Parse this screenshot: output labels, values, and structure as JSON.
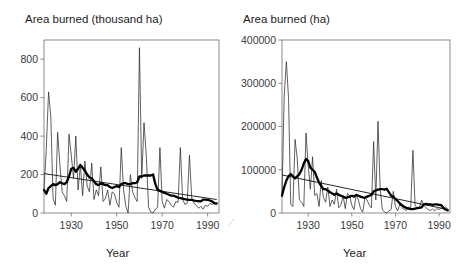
{
  "figure": {
    "panels": [
      {
        "id": "left",
        "title": "Area burned (thousand ha)",
        "xlabel": "Year",
        "ylabel": ""
      },
      {
        "id": "right",
        "title": "Area burned (ha)",
        "xlabel": "Year",
        "ylabel": ""
      }
    ]
  },
  "chart_data": [
    {
      "type": "line",
      "title": "Area burned (thousand ha)",
      "xlabel": "Year",
      "ylabel": "Area burned (thousand ha)",
      "xlim": [
        1918,
        1995
      ],
      "ylim": [
        0,
        900
      ],
      "xticks": [
        1930,
        1950,
        1970,
        1990
      ],
      "yticks": [
        0,
        200,
        400,
        600,
        800
      ],
      "ytick_labels": [
        "0",
        "200",
        "400",
        "600",
        "800"
      ],
      "xtick_labels": [
        "1930",
        "1950",
        "1970",
        "1990"
      ],
      "grid": false,
      "legend": "none",
      "series": [
        {
          "name": "Annual area burned",
          "style": "thin-line",
          "x": [
            1918,
            1919,
            1920,
            1921,
            1922,
            1923,
            1924,
            1925,
            1926,
            1927,
            1928,
            1929,
            1930,
            1931,
            1932,
            1933,
            1934,
            1935,
            1936,
            1937,
            1938,
            1939,
            1940,
            1941,
            1942,
            1943,
            1944,
            1945,
            1946,
            1947,
            1948,
            1949,
            1950,
            1951,
            1952,
            1953,
            1954,
            1955,
            1956,
            1957,
            1958,
            1959,
            1960,
            1961,
            1962,
            1963,
            1964,
            1965,
            1966,
            1967,
            1968,
            1969,
            1970,
            1971,
            1972,
            1973,
            1974,
            1975,
            1976,
            1977,
            1978,
            1979,
            1980,
            1981,
            1982,
            1983,
            1984,
            1985,
            1986,
            1987,
            1988,
            1989,
            1990,
            1991,
            1992,
            1993,
            1994
          ],
          "values": [
            120,
            330,
            630,
            500,
            75,
            40,
            420,
            250,
            110,
            90,
            60,
            410,
            300,
            180,
            400,
            120,
            250,
            90,
            270,
            140,
            110,
            260,
            70,
            120,
            90,
            240,
            60,
            75,
            120,
            40,
            110,
            100,
            55,
            30,
            340,
            120,
            35,
            0,
            200,
            110,
            80,
            60,
            860,
            180,
            470,
            300,
            30,
            5,
            0,
            20,
            30,
            340,
            60,
            25,
            70,
            60,
            40,
            30,
            60,
            55,
            340,
            70,
            45,
            50,
            300,
            80,
            50,
            40,
            25,
            35,
            20,
            40,
            35,
            50,
            45,
            55,
            40
          ]
        },
        {
          "name": "Smoothed (running mean)",
          "style": "thick-line",
          "x": [
            1918,
            1919,
            1920,
            1921,
            1922,
            1923,
            1924,
            1925,
            1926,
            1927,
            1928,
            1929,
            1930,
            1931,
            1932,
            1933,
            1934,
            1935,
            1936,
            1937,
            1938,
            1939,
            1940,
            1941,
            1942,
            1943,
            1944,
            1945,
            1946,
            1947,
            1948,
            1949,
            1950,
            1951,
            1952,
            1953,
            1954,
            1955,
            1956,
            1957,
            1958,
            1959,
            1960,
            1961,
            1962,
            1963,
            1964,
            1965,
            1966,
            1967,
            1968,
            1969,
            1970,
            1971,
            1972,
            1973,
            1974,
            1975,
            1976,
            1977,
            1978,
            1979,
            1980,
            1981,
            1982,
            1983,
            1984,
            1985,
            1986,
            1987,
            1988,
            1989,
            1990,
            1991,
            1992,
            1993,
            1994
          ],
          "values": [
            120,
            100,
            130,
            140,
            150,
            145,
            150,
            160,
            155,
            150,
            160,
            190,
            230,
            235,
            215,
            230,
            250,
            235,
            220,
            200,
            185,
            180,
            165,
            150,
            145,
            155,
            150,
            145,
            145,
            135,
            130,
            135,
            140,
            135,
            150,
            155,
            155,
            150,
            150,
            155,
            155,
            160,
            190,
            190,
            195,
            195,
            195,
            195,
            200,
            150,
            120,
            115,
            110,
            105,
            100,
            95,
            90,
            90,
            85,
            80,
            78,
            75,
            72,
            70,
            68,
            68,
            65,
            62,
            62,
            60,
            70,
            70,
            68,
            65,
            60,
            50,
            50
          ]
        },
        {
          "name": "Linear trend",
          "style": "thin-straight",
          "x": [
            1918,
            1994
          ],
          "values": [
            205,
            70
          ]
        }
      ]
    },
    {
      "type": "line",
      "title": "Area burned (ha)",
      "xlabel": "Year",
      "ylabel": "Area burned (ha)",
      "xlim": [
        1918,
        1995
      ],
      "ylim": [
        0,
        400000
      ],
      "xticks": [
        1930,
        1950,
        1970,
        1990
      ],
      "yticks": [
        0,
        100000,
        200000,
        300000,
        400000
      ],
      "ytick_labels": [
        "0",
        "100000",
        "200000",
        "300000",
        "400000"
      ],
      "xtick_labels": [
        "1930",
        "1950",
        "1970",
        "1990"
      ],
      "grid": false,
      "legend": "none",
      "series": [
        {
          "name": "Annual area burned",
          "style": "thin-line",
          "x": [
            1918,
            1919,
            1920,
            1921,
            1922,
            1923,
            1924,
            1925,
            1926,
            1927,
            1928,
            1929,
            1930,
            1931,
            1932,
            1933,
            1934,
            1935,
            1936,
            1937,
            1938,
            1939,
            1940,
            1941,
            1942,
            1943,
            1944,
            1945,
            1946,
            1947,
            1948,
            1949,
            1950,
            1951,
            1952,
            1953,
            1954,
            1955,
            1956,
            1957,
            1958,
            1959,
            1960,
            1961,
            1962,
            1963,
            1964,
            1965,
            1966,
            1967,
            1968,
            1969,
            1970,
            1971,
            1972,
            1973,
            1974,
            1975,
            1976,
            1977,
            1978,
            1979,
            1980,
            1981,
            1982,
            1983,
            1984,
            1985,
            1986,
            1987,
            1988,
            1989,
            1990,
            1991,
            1992,
            1993,
            1994
          ],
          "values": [
            40000,
            270000,
            350000,
            265000,
            20000,
            15000,
            170000,
            125000,
            30000,
            25000,
            15000,
            185000,
            110000,
            55000,
            130000,
            40000,
            45000,
            15000,
            75000,
            35000,
            25000,
            60000,
            15000,
            30000,
            20000,
            55000,
            12000,
            18000,
            40000,
            10000,
            45000,
            40000,
            18000,
            8000,
            42000,
            30000,
            10000,
            2000,
            35000,
            30000,
            18000,
            12000,
            165000,
            30000,
            212000,
            55000,
            8000,
            2000,
            0,
            5000,
            8000,
            50000,
            15000,
            5000,
            20000,
            12000,
            8000,
            6000,
            14000,
            12000,
            145000,
            18000,
            10000,
            12000,
            30000,
            18000,
            12000,
            8000,
            6000,
            9000,
            5000,
            10000,
            8000,
            12000,
            10000,
            14000,
            9000
          ]
        },
        {
          "name": "Smoothed (running mean)",
          "style": "thick-line",
          "x": [
            1918,
            1919,
            1920,
            1921,
            1922,
            1923,
            1924,
            1925,
            1926,
            1927,
            1928,
            1929,
            1930,
            1931,
            1932,
            1933,
            1934,
            1935,
            1936,
            1937,
            1938,
            1939,
            1940,
            1941,
            1942,
            1943,
            1944,
            1945,
            1946,
            1947,
            1948,
            1949,
            1950,
            1951,
            1952,
            1953,
            1954,
            1955,
            1956,
            1957,
            1958,
            1959,
            1960,
            1961,
            1962,
            1963,
            1964,
            1965,
            1966,
            1967,
            1968,
            1969,
            1970,
            1971,
            1972,
            1973,
            1974,
            1975,
            1976,
            1977,
            1978,
            1979,
            1980,
            1981,
            1982,
            1983,
            1984,
            1985,
            1986,
            1987,
            1988,
            1989,
            1990,
            1991,
            1992,
            1993,
            1994
          ],
          "values": [
            40000,
            60000,
            75000,
            85000,
            90000,
            85000,
            80000,
            85000,
            90000,
            100000,
            115000,
            125000,
            120000,
            105000,
            100000,
            95000,
            82000,
            70000,
            62000,
            55000,
            55000,
            52000,
            48000,
            45000,
            42000,
            45000,
            42000,
            40000,
            38000,
            35000,
            36000,
            38000,
            40000,
            38000,
            42000,
            40000,
            38000,
            36000,
            35000,
            38000,
            40000,
            42000,
            50000,
            52000,
            54000,
            55000,
            55000,
            54000,
            56000,
            48000,
            40000,
            38000,
            32000,
            28000,
            22000,
            18000,
            14000,
            12000,
            10000,
            9000,
            9000,
            10000,
            11000,
            12000,
            13000,
            20000,
            21000,
            20000,
            20000,
            19000,
            20000,
            20000,
            19000,
            18000,
            12000,
            8000,
            6000
          ]
        },
        {
          "name": "Linear trend",
          "style": "thin-straight",
          "x": [
            1918,
            1994
          ],
          "values": [
            88000,
            8000
          ]
        }
      ]
    }
  ]
}
